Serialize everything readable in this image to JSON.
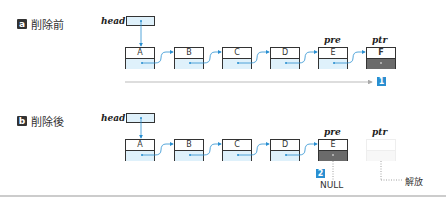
{
  "before": {
    "badge": "a",
    "title": "削除前",
    "head_label": "head",
    "nodes": [
      "A",
      "B",
      "C",
      "D",
      "E",
      "F"
    ],
    "pre_label": "pre",
    "ptr_label": "ptr",
    "step": "1"
  },
  "after": {
    "badge": "b",
    "title": "削除後",
    "head_label": "head",
    "nodes": [
      "A",
      "B",
      "C",
      "D",
      "E"
    ],
    "pre_label": "pre",
    "ptr_label": "ptr",
    "step": "2",
    "null_label": "NULL",
    "free_label": "解放"
  },
  "colors": {
    "accent": "#2a8fd1",
    "node_fill": "#dff1fb",
    "dark_fill": "#6b6b6b"
  }
}
